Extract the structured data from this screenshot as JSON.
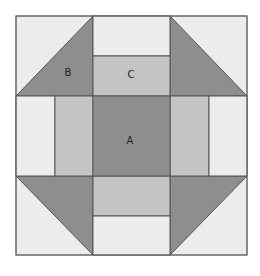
{
  "diagram": {
    "colors": {
      "light": "#ececec",
      "medium": "#c4c4c4",
      "dark": "#8e8e8e",
      "stroke": "#555555"
    },
    "labels": {
      "A": "A",
      "B": "B",
      "C": "C"
    }
  }
}
